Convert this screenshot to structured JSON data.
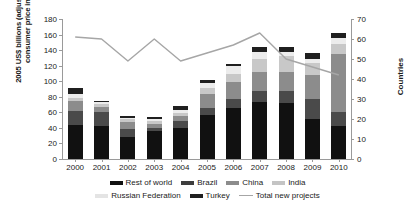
{
  "chart_data": {
    "type": "bar",
    "title": "",
    "xlabel": "",
    "ylabel": "2005 US$ billions (adjusted by US consumer price index)",
    "ylabel_secondary": "Countries",
    "categories": [
      "2000",
      "2001",
      "2002",
      "2003",
      "2004",
      "2005",
      "2006",
      "2007",
      "2008",
      "2009",
      "2010"
    ],
    "ylim": [
      0,
      180
    ],
    "ylim_secondary": [
      0,
      70
    ],
    "ytick_labels": [
      "0",
      "20",
      "40",
      "60",
      "80",
      "100",
      "120",
      "140",
      "160",
      "180"
    ],
    "ytick_values": [
      0,
      20,
      40,
      60,
      80,
      100,
      120,
      140,
      160,
      180
    ],
    "ytick_labels_secondary": [
      "0",
      "10",
      "20",
      "30",
      "40",
      "50",
      "60",
      "70"
    ],
    "ytick_values_secondary": [
      0,
      10,
      20,
      30,
      40,
      50,
      60,
      70
    ],
    "grid": false,
    "legend_position": "bottom",
    "stacked": true,
    "series": [
      {
        "name": "Rest of world",
        "color": "#111111",
        "values": [
          44,
          42,
          28,
          36,
          40,
          56,
          65,
          73,
          72,
          52,
          43
        ]
      },
      {
        "name": "Brazil",
        "color": "#4a4a4a",
        "values": [
          18,
          18,
          11,
          4,
          9,
          10,
          12,
          14,
          15,
          25,
          17
        ]
      },
      {
        "name": "China",
        "color": "#8c8c8c",
        "values": [
          12,
          7,
          9,
          5,
          6,
          18,
          22,
          25,
          25,
          31,
          75
        ]
      },
      {
        "name": "India",
        "color": "#c8c8c8",
        "values": [
          5,
          4,
          3,
          4,
          4,
          7,
          10,
          16,
          20,
          16,
          13
        ]
      },
      {
        "name": "Russian Federation",
        "color": "#ececec",
        "values": [
          5,
          2,
          2,
          3,
          4,
          7,
          10,
          9,
          5,
          5,
          7
        ]
      },
      {
        "name": "Turkey",
        "color": "#1f1f1f",
        "values": [
          7,
          2,
          2,
          2,
          5,
          4,
          3,
          7,
          7,
          7,
          7
        ]
      }
    ],
    "line_series": {
      "name": "Total new projects",
      "color": "#a6a6a6",
      "axis": "secondary",
      "values": [
        61,
        60,
        49,
        60,
        49,
        53,
        57,
        63,
        50,
        46,
        42
      ]
    }
  },
  "legend": {
    "row1": [
      {
        "label": "Rest of world",
        "color": "#111111",
        "type": "swatch"
      },
      {
        "label": "Brazil",
        "color": "#3d3d3d",
        "type": "swatch"
      },
      {
        "label": "China",
        "color": "#8c8c8c",
        "type": "swatch"
      },
      {
        "label": "India",
        "color": "#c4c4c4",
        "type": "swatch"
      }
    ],
    "row2": [
      {
        "label": "Russian Federation",
        "color": "#e4e4e4",
        "type": "swatch"
      },
      {
        "label": "Turkey",
        "color": "#1f1f1f",
        "type": "swatch"
      },
      {
        "label": "Total new projects",
        "color": "#a6a6a6",
        "type": "line"
      }
    ]
  }
}
